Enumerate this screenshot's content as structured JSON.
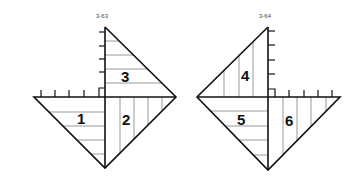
{
  "figures": [
    {
      "id": "3-63",
      "label": "3-63",
      "regions": [
        {
          "number": "1",
          "hatch": "horizontal"
        },
        {
          "number": "2",
          "hatch": "vertical"
        },
        {
          "number": "3",
          "hatch": "horizontal"
        }
      ],
      "axis_ticks": {
        "vertical": 5,
        "horizontal": 5
      }
    },
    {
      "id": "3-64",
      "label": "3-64",
      "regions": [
        {
          "number": "4",
          "hatch": "vertical"
        },
        {
          "number": "5",
          "hatch": "horizontal"
        },
        {
          "number": "6",
          "hatch": "vertical"
        }
      ],
      "axis_ticks": {
        "vertical": 5,
        "horizontal": 5
      }
    }
  ],
  "colors": {
    "line": "#111111",
    "hatch": "#555555",
    "background": "#ffffff"
  }
}
